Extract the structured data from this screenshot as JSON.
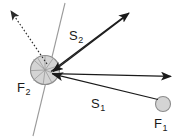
{
  "figure": {
    "background_color": "#ffffff",
    "width": 182,
    "height": 139,
    "labels": {
      "s2": {
        "base": "S",
        "sub": "2",
        "x": 69,
        "y": 29
      },
      "s1": {
        "base": "S",
        "sub": "1",
        "x": 91,
        "y": 97
      },
      "f2": {
        "base": "F",
        "sub": "2",
        "x": 17,
        "y": 81
      },
      "f1": {
        "base": "F",
        "sub": "1",
        "x": 154,
        "y": 117
      }
    },
    "colors": {
      "vector_stroke": "#1a1a1a",
      "body_fill": "#d4d4d4",
      "body_stroke": "#8c8c8c",
      "guide_line": "#9a9a9a",
      "dotted_vector": "#2b2b2b",
      "label_text": "#1a1a1a"
    },
    "bodies": [
      {
        "name": "body-F2",
        "label": "F2",
        "cx": 45,
        "cy": 70,
        "r": 14.5,
        "fill": "#d4d4d4",
        "stroke": "#8c8c8c"
      },
      {
        "name": "body-F1",
        "label": "F1",
        "cx": 163,
        "cy": 104,
        "r": 7.5,
        "fill": "#d4d4d4",
        "stroke": "#8c8c8c"
      }
    ],
    "vectors": [
      {
        "name": "vector-S2-outgoing",
        "label": "S2",
        "style": "solid",
        "from": [
          50,
          72
        ],
        "to": [
          130,
          12
        ]
      },
      {
        "name": "vector-S2-incoming",
        "label": "S2",
        "style": "solid",
        "from": [
          130,
          12
        ],
        "to": [
          52,
          72
        ]
      },
      {
        "name": "vector-S1-outgoing",
        "label": "S1",
        "style": "solid",
        "from": [
          52,
          74
        ],
        "to": [
          172,
          76
        ]
      },
      {
        "name": "vector-S1-incoming",
        "label": "S1",
        "style": "solid",
        "from": [
          160,
          100
        ],
        "to": [
          52,
          74
        ]
      },
      {
        "name": "vector-reaction-dotted",
        "label": "",
        "style": "dotted",
        "from": [
          47,
          64
        ],
        "to": [
          9,
          9
        ]
      }
    ],
    "guide_lines": [
      {
        "name": "contact-normal-line",
        "from": [
          65,
          3
        ],
        "to": [
          33,
          136
        ]
      }
    ],
    "contact_fan_rays": [
      {
        "name": "fan-ray-1",
        "from": [
          45,
          70
        ],
        "to": [
          37,
          57
        ]
      },
      {
        "name": "fan-ray-2",
        "from": [
          45,
          70
        ],
        "to": [
          45,
          56
        ]
      },
      {
        "name": "fan-ray-3",
        "from": [
          45,
          70
        ],
        "to": [
          53,
          58
        ]
      },
      {
        "name": "fan-ray-4",
        "from": [
          45,
          70
        ],
        "to": [
          58,
          66
        ]
      },
      {
        "name": "fan-ray-5",
        "from": [
          45,
          70
        ],
        "to": [
          58,
          76
        ]
      },
      {
        "name": "fan-ray-6",
        "from": [
          45,
          70
        ],
        "to": [
          52,
          83
        ]
      },
      {
        "name": "fan-ray-7",
        "from": [
          45,
          70
        ],
        "to": [
          43,
          84
        ]
      },
      {
        "name": "fan-ray-8",
        "from": [
          45,
          70
        ],
        "to": [
          33,
          80
        ]
      },
      {
        "name": "fan-ray-9",
        "from": [
          45,
          70
        ],
        "to": [
          31,
          70
        ]
      },
      {
        "name": "fan-ray-10",
        "from": [
          45,
          70
        ],
        "to": [
          33,
          60
        ]
      }
    ]
  }
}
